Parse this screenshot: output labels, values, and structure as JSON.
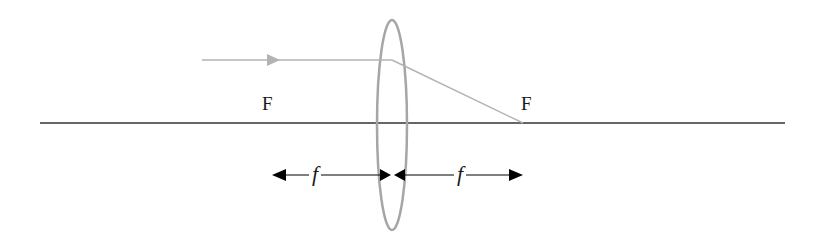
{
  "diagram": {
    "type": "converging-lens-ray-diagram",
    "colors": {
      "background": "#ffffff",
      "axis": "#333333",
      "lens": "#a6a6a6",
      "ray": "#b3b3b3",
      "dimension": "#000000",
      "text": "#1a1a1a"
    },
    "labels": {
      "focal_left": "F",
      "focal_right": "F",
      "focal_length_left": "f",
      "focal_length_right": "f"
    },
    "geometry": {
      "axis": {
        "x1": 40,
        "x2": 785,
        "y": 123
      },
      "lens": {
        "cx": 392,
        "cy": 125,
        "rx": 15,
        "ry": 105
      },
      "ray_incident": {
        "x1": 202,
        "y1": 60,
        "x2": 392,
        "y2": 60
      },
      "ray_refracted": {
        "x1": 392,
        "y1": 60,
        "x2": 523,
        "y2": 123
      },
      "focal_points": {
        "left_x": 262,
        "right_x": 523
      },
      "dimension_line_y": 175
    }
  }
}
